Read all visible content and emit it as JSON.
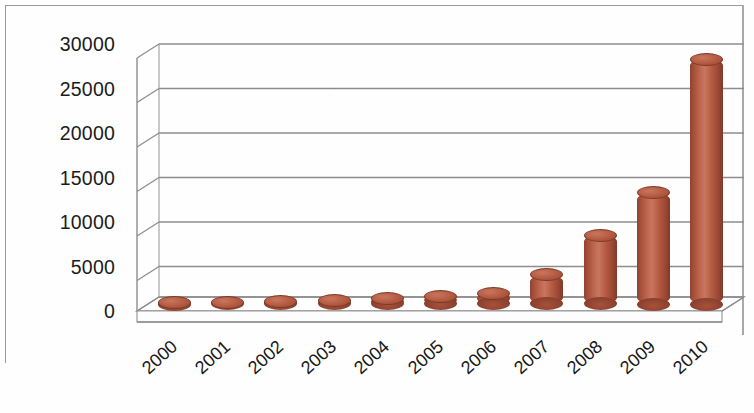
{
  "chart_data": {
    "type": "bar",
    "title": "",
    "subtitle": "",
    "xlabel": "",
    "ylabel": "",
    "categories": [
      "2000",
      "2001",
      "2002",
      "2003",
      "2004",
      "2005",
      "2006",
      "2007",
      "2008",
      "2009",
      "2010"
    ],
    "values": [
      150,
      200,
      250,
      350,
      600,
      850,
      1200,
      3300,
      7700,
      12500,
      27500
    ],
    "series": [
      {
        "name": "",
        "values": [
          150,
          200,
          250,
          350,
          600,
          850,
          1200,
          3300,
          7700,
          12500,
          27500
        ]
      }
    ],
    "ylim": [
      0,
      30000
    ],
    "y_tick_labels": [
      "0",
      "5000",
      "10000",
      "15000",
      "20000",
      "25000",
      "30000"
    ],
    "y_tick_values": [
      0,
      5000,
      10000,
      15000,
      20000,
      25000,
      30000
    ],
    "y_tick_interval": 5000,
    "x_tick_labels": [
      "2000",
      "2001",
      "2002",
      "2003",
      "2004",
      "2005",
      "2006",
      "2007",
      "2008",
      "2009",
      "2010"
    ],
    "x_label_rotation_deg": -42,
    "grid": true,
    "grid_axis": "y",
    "legend": false,
    "legend_position": "none",
    "three_d": true,
    "bar_shape": "cylinder",
    "bar_color": "#b5593f",
    "bar_color_dark": "#7e3a2a",
    "bar_color_light": "#c9765e",
    "grid_color": "#8d8d8d",
    "axis_text_color": "#1b1b1b",
    "background_color": "#ffffff",
    "frame_color": "#9a9a9a"
  }
}
